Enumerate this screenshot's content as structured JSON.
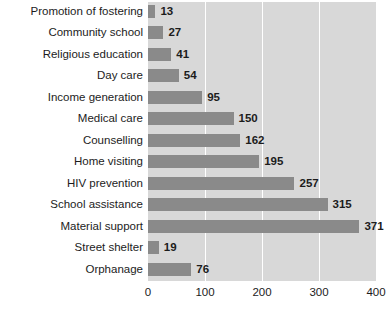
{
  "chart_data": {
    "type": "bar",
    "orientation": "horizontal",
    "title": "",
    "xlabel": "",
    "ylabel": "",
    "xlim": [
      0,
      400
    ],
    "xticks": [
      0,
      100,
      200,
      300,
      400
    ],
    "grid": true,
    "legend": false,
    "categories": [
      "Promotion of fostering",
      "Community school",
      "Religious education",
      "Day care",
      "Income generation",
      "Medical care",
      "Counselling",
      "Home visiting",
      "HIV prevention",
      "School assistance",
      "Material support",
      "Street shelter",
      "Orphanage"
    ],
    "values": [
      13,
      27,
      41,
      54,
      95,
      150,
      162,
      195,
      257,
      315,
      371,
      19,
      76
    ],
    "bar_color": "#8a8a8a",
    "plot_background": "#d8d8d8",
    "gridline_color": "#ffffff",
    "text_color": "#1c1c1c"
  }
}
